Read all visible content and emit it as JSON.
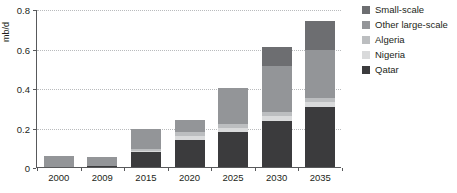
{
  "chart_data": {
    "type": "bar",
    "stacked": true,
    "title": "",
    "xlabel": "",
    "ylabel": "mb/d",
    "ylim": [
      0,
      0.8
    ],
    "yticks": [
      0,
      0.2,
      0.4,
      0.6,
      0.8
    ],
    "ytick_labels": [
      "0",
      "0.2",
      "0.4",
      "0.6",
      "0.8"
    ],
    "grid": true,
    "legend_position": "right",
    "categories": [
      "2000",
      "2009",
      "2015",
      "2020",
      "2025",
      "2030",
      "2035"
    ],
    "series": [
      {
        "name": "Qatar",
        "color": "#3b3b3d",
        "values": [
          0.0,
          0.007,
          0.075,
          0.135,
          0.175,
          0.235,
          0.305
        ]
      },
      {
        "name": "Nigeria",
        "color": "#d9dadb",
        "values": [
          0.0,
          0.0,
          0.008,
          0.022,
          0.022,
          0.022,
          0.022
        ]
      },
      {
        "name": "Algeria",
        "color": "#bcbec0",
        "values": [
          0.0,
          0.0,
          0.008,
          0.02,
          0.02,
          0.02,
          0.02
        ]
      },
      {
        "name": "Other large-scale",
        "color": "#939598",
        "values": [
          0.055,
          0.043,
          0.099,
          0.063,
          0.183,
          0.235,
          0.245
        ]
      },
      {
        "name": "Small-scale",
        "color": "#6d6e71",
        "values": [
          0.0,
          0.0,
          0.0,
          0.0,
          0.0,
          0.098,
          0.148
        ]
      }
    ],
    "totals": [
      0.055,
      0.05,
      0.19,
      0.24,
      0.4,
      0.61,
      0.74
    ]
  },
  "legend": {
    "items": [
      {
        "label": "Small-scale",
        "color": "#6d6e71"
      },
      {
        "label": "Other large-scale",
        "color": "#939598"
      },
      {
        "label": "Algeria",
        "color": "#bcbec0"
      },
      {
        "label": "Nigeria",
        "color": "#d9dadb"
      },
      {
        "label": "Qatar",
        "color": "#3b3b3d"
      }
    ]
  },
  "axis": {
    "y_title": "mb/d"
  }
}
